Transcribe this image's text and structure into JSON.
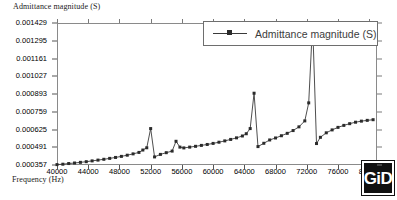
{
  "chart_data": {
    "type": "line",
    "title": "",
    "xlabel": "Frequency (Hz)",
    "ylabel": "Admittance magnitude (S)",
    "legend": [
      "Admittance magnitude (S)"
    ],
    "legend_position": "top-right",
    "grid": false,
    "xlim": [
      40000,
      81000
    ],
    "ylim": [
      0.000357,
      0.001429
    ],
    "xticks": [
      40000,
      44000,
      48000,
      52000,
      56000,
      60000,
      64000,
      68000,
      72000,
      76000,
      80000
    ],
    "xtick_labels": [
      "40000",
      "44000",
      "48000",
      "52000",
      "56000",
      "60000",
      "64000",
      "68000",
      "72000",
      "76000",
      "80000"
    ],
    "yticks": [
      0.000357,
      0.000491,
      0.000625,
      0.000759,
      0.000893,
      0.001027,
      0.001161,
      0.001295,
      0.001429
    ],
    "ytick_labels": [
      "0.000357",
      "0.000491",
      "0.000625",
      "0.000759",
      "0.000893",
      "0.001027",
      "0.001161",
      "0.001295",
      "0.001429"
    ],
    "marker": "square",
    "line_color": "#3a3a3a",
    "marker_color": "#2b2b2b",
    "series": [
      {
        "name": "Admittance magnitude (S)",
        "x": [
          40000,
          40750,
          41500,
          42250,
          43000,
          43750,
          44500,
          45250,
          46000,
          46750,
          47500,
          48250,
          49000,
          49750,
          50500,
          51000,
          51500,
          52000,
          52500,
          53250,
          54000,
          54750,
          55250,
          55750,
          56250,
          57000,
          57750,
          58500,
          59250,
          60000,
          60750,
          61500,
          62250,
          63000,
          63750,
          64250,
          64750,
          65250,
          65750,
          66500,
          67250,
          68000,
          68750,
          69500,
          70250,
          71000,
          71750,
          72250,
          72750,
          73250,
          73750,
          74500,
          75250,
          76000,
          76750,
          77500,
          78250,
          79000,
          79750,
          80500
        ],
        "y": [
          0.00036,
          0.000363,
          0.000368,
          0.000372,
          0.000377,
          0.000382,
          0.000388,
          0.000394,
          0.0004,
          0.000407,
          0.000414,
          0.000422,
          0.000431,
          0.000441,
          0.000452,
          0.00047,
          0.000487,
          0.000632,
          0.000418,
          0.000437,
          0.00045,
          0.000462,
          0.000536,
          0.000492,
          0.000486,
          0.000492,
          0.000498,
          0.000505,
          0.000512,
          0.00052,
          0.000529,
          0.000539,
          0.00055,
          0.000562,
          0.000576,
          0.000593,
          0.000632,
          0.000899,
          0.000496,
          0.000521,
          0.000546,
          0.000561,
          0.000578,
          0.000596,
          0.000617,
          0.000645,
          0.00069,
          0.000826,
          0.001429,
          0.000519,
          0.000566,
          0.0006,
          0.000622,
          0.000641,
          0.000656,
          0.000669,
          0.00068,
          0.000688,
          0.000694,
          0.000699
        ]
      }
    ]
  },
  "watermark": {
    "text": "GiD"
  }
}
